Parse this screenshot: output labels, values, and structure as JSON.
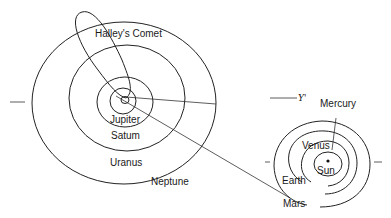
{
  "diagram": {
    "outer_system": {
      "comet_label": "Halley's Comet",
      "planets": [
        {
          "name": "Jupiter"
        },
        {
          "name": "Satum"
        },
        {
          "name": "Uranus"
        },
        {
          "name": "Neptune"
        }
      ]
    },
    "inner_system": {
      "vernal_equinox_symbol": "Υ'",
      "sun_label": "Sun",
      "planets": [
        {
          "name": "Mercury"
        },
        {
          "name": "Venus"
        },
        {
          "name": "Earth"
        },
        {
          "name": "Mars"
        }
      ]
    }
  }
}
